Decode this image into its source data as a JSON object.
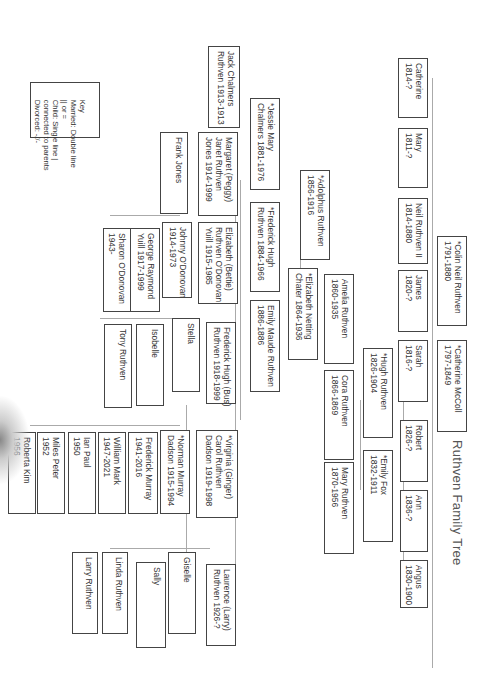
{
  "title": "Ruthven Family Tree",
  "key": {
    "heading": "Key",
    "lines": [
      "Married: Double line",
      "|| or =",
      "Child: Single line |",
      "connected to parents",
      "Divorced: -//-"
    ]
  },
  "people": {
    "catherine": "Catherine\n1814-?",
    "mary_1811": "Mary\n1811-?",
    "neil_ii": "Neil Ruthven II\n1814-1880",
    "james": "James\n1820-?",
    "sarah": "Sarah\n1816-?",
    "robert": "Robert\n1826-?",
    "ann": "Ann\n1836-?",
    "angus": "Angus\n1830-1900",
    "colin": "*Colin Neil Ruthven\n1791-1880",
    "catherine_mccoll": "*Catherine McColl\n1797-1849",
    "hugh": "*Hugh Ruthven\n1826-1904",
    "emily_fox": "*Emily Fox\n1832-1911",
    "amelia": "Amelia Ruthven\n1860-1935",
    "cora": "Cora Ruthven\n1866-1869",
    "mary_1870": "Mary Ruthven\n1870-1956",
    "adolphus": "*Adolphus Ruthven\n1856-1916",
    "elizabeth_chater": "*Elizabeth Netting\nChater 1864-1936",
    "jessie": "*Jessie Mary\nChalmers 1881-1976",
    "frederick_1884": "*Frederick Hugh\nRuthven 1884-1966",
    "emily_maude": "Emily Maude Ruthven\n1886-1886",
    "jack": "Jack Chalmers\nRuthven 1913-1913",
    "margaret": "Margaret (Peggy)\nJanet Ruthven\nJones 1914-1999",
    "frank": "Frank Jones",
    "elizabeth_bettie": "Elizabeth (Bettie)\nRuthven O'Donovan\nYuill 1915-1985",
    "johnny": "Johnny O'Donovan\n1914-1973",
    "george": "George Raymond\nYuill 1917-1999",
    "sharon": "Sharon O'Donovan\n1943-",
    "frederick_bus": "Frederick Hugh (Bus)\nRuthven 1918-1999",
    "stella": "Stella",
    "isobelle": "Isobelle",
    "tony": "Tony Ruthven",
    "virginia": "*Virginia (Ginger)\nCarol Ruthven\nDadson 1919-1998",
    "norman": "*Norman Murray\nDadson 1915-1994",
    "frederick_murray": "Frederick Murray\n1941-2016",
    "william": "William Mark\n1947-2021",
    "ian": "Ian Paul\n1950",
    "miles": "Miles Peter\n1952",
    "roberta": "Roberta Kim\n1956",
    "laurence": "Laurence (Larry)\nRuthven 1926-?",
    "giselle": "Giselle",
    "sally": "Sally",
    "linda": "Linda Ruthven",
    "larry": "Larry Ruthven"
  }
}
